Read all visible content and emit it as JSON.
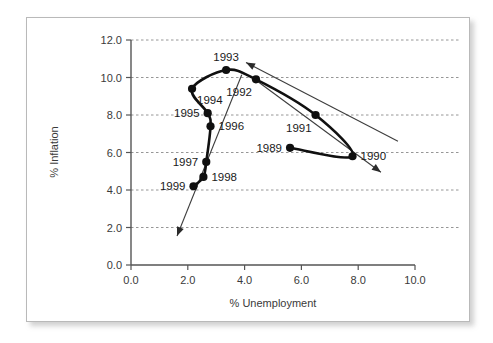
{
  "figure": {
    "kind": "scatter-line-chart",
    "border_color": "#b9b9b9",
    "background": "#ffffff"
  },
  "chart_data": {
    "type": "line",
    "title": "",
    "subtitle": "",
    "xlabel": "% Unemployment",
    "ylabel": "% Inflation",
    "xlim": [
      0.0,
      10.0
    ],
    "ylim": [
      0.0,
      12.0
    ],
    "xticks": [
      "0.0",
      "2.0",
      "4.0",
      "6.0",
      "8.0",
      "10.0"
    ],
    "yticks": [
      "0.0",
      "2.0",
      "4.0",
      "6.0",
      "8.0",
      "10.0",
      "12.0"
    ],
    "xtick_values": [
      0.0,
      2.0,
      4.0,
      6.0,
      8.0,
      10.0
    ],
    "ytick_values": [
      0.0,
      2.0,
      4.0,
      6.0,
      8.0,
      10.0,
      12.0
    ],
    "grid": "horizontal-dashed",
    "legend": "none",
    "series": [
      {
        "name": "Phillips curve loop 1989-1999",
        "marker": "filled-circle",
        "color": "#101010",
        "points": [
          {
            "label": "1989",
            "x": 5.6,
            "y": 6.25,
            "label_pos": "left"
          },
          {
            "label": "1990",
            "x": 7.8,
            "y": 5.8,
            "label_pos": "right"
          },
          {
            "label": "1991",
            "x": 6.5,
            "y": 8.0,
            "label_pos": "below-left"
          },
          {
            "label": "1992",
            "x": 4.4,
            "y": 9.9,
            "label_pos": "below-left"
          },
          {
            "label": "1993",
            "x": 3.35,
            "y": 10.4,
            "label_pos": "above"
          },
          {
            "label": "1994",
            "x": 2.15,
            "y": 9.4,
            "label_pos": "below-right"
          },
          {
            "label": "1995",
            "x": 2.7,
            "y": 8.1,
            "label_pos": "left"
          },
          {
            "label": "1996",
            "x": 2.8,
            "y": 7.4,
            "label_pos": "right"
          },
          {
            "label": "1997",
            "x": 2.65,
            "y": 5.5,
            "label_pos": "left"
          },
          {
            "label": "1998",
            "x": 2.55,
            "y": 4.7,
            "label_pos": "right"
          },
          {
            "label": "1999",
            "x": 2.2,
            "y": 4.2,
            "label_pos": "left"
          }
        ]
      }
    ],
    "annotations": [
      {
        "name": "upper-trend-arrow",
        "from": {
          "x": 9.4,
          "y": 6.6
        },
        "to": {
          "x": 4.05,
          "y": 10.8
        },
        "style": "thin-line-with-arrowhead"
      },
      {
        "name": "lower-trend-arrow",
        "from": {
          "x": 4.45,
          "y": 9.8
        },
        "to": {
          "x": 8.8,
          "y": 4.95
        },
        "style": "thin-line-with-arrowhead"
      },
      {
        "name": "downward-trend-arrow",
        "from": {
          "x": 3.9,
          "y": 10.15
        },
        "to": {
          "x": 1.62,
          "y": 1.55
        },
        "style": "thin-line-with-arrowhead"
      }
    ]
  }
}
